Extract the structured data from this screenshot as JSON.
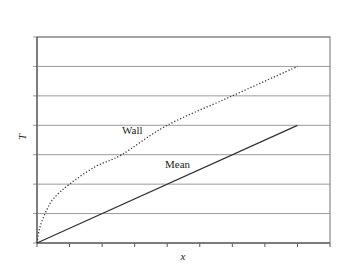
{
  "chart_data": {
    "type": "line",
    "title": "",
    "xlabel": "x",
    "ylabel": "T",
    "xlim": [
      0,
      9
    ],
    "ylim": [
      0,
      7
    ],
    "x_ticks": [
      0,
      1,
      2,
      3,
      4,
      5,
      6,
      7,
      8,
      9
    ],
    "y_gridlines": [
      0,
      1,
      2,
      3,
      4,
      5,
      6,
      7
    ],
    "tick_labels_shown": false,
    "grid": "horizontal",
    "legend": "none (inline labels)",
    "series": [
      {
        "name": "Wall",
        "style": "dotted",
        "color": "#333333",
        "x": [
          0,
          0.08,
          0.25,
          0.5,
          1.0,
          1.8,
          2.6,
          4.0,
          6.0,
          8.0
        ],
        "y": [
          0,
          0.5,
          1.0,
          1.5,
          2.0,
          2.6,
          3.0,
          4.0,
          5.0,
          6.0
        ]
      },
      {
        "name": "Mean",
        "style": "solid",
        "color": "#333333",
        "x": [
          0,
          8
        ],
        "y": [
          0,
          4
        ]
      }
    ],
    "annotations": [
      {
        "text": "Wall",
        "x": 2.6,
        "y": 3.8
      },
      {
        "text": "Mean",
        "x": 4.0,
        "y": 2.7
      }
    ]
  },
  "labels": {
    "x_axis": "x",
    "y_axis": "T",
    "wall": "Wall",
    "mean": "Mean"
  }
}
